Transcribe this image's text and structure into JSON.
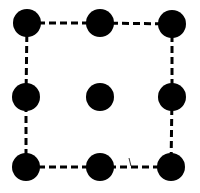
{
  "diagram": {
    "width": 200,
    "height": 193,
    "background": "#ffffff",
    "dot_color": "#000000",
    "dot_radius": 14,
    "line_color": "#000000",
    "line_width": 3,
    "dash_pattern": "7 4",
    "grid": {
      "rows": 3,
      "cols": 3
    },
    "dots": [
      {
        "id": "r1c1",
        "x": 27,
        "y": 23
      },
      {
        "id": "r1c2",
        "x": 100,
        "y": 23
      },
      {
        "id": "r1c3",
        "x": 172,
        "y": 24
      },
      {
        "id": "r2c1",
        "x": 26,
        "y": 97
      },
      {
        "id": "r2c2",
        "x": 100,
        "y": 97
      },
      {
        "id": "r2c3",
        "x": 172,
        "y": 97
      },
      {
        "id": "r3c1",
        "x": 26,
        "y": 167
      },
      {
        "id": "r3c2",
        "x": 100,
        "y": 167
      },
      {
        "id": "r3c3",
        "x": 171,
        "y": 167
      }
    ],
    "dashed_edges": [
      {
        "from": "r1c1",
        "to": "r1c2"
      },
      {
        "from": "r1c2",
        "to": "r1c3"
      },
      {
        "from": "r1c3",
        "to": "r2c3"
      },
      {
        "from": "r2c3",
        "to": "r3c3"
      },
      {
        "from": "r3c3",
        "to": "r3c2"
      },
      {
        "from": "r3c2",
        "to": "r3c1"
      },
      {
        "from": "r3c1",
        "to": "r2c1"
      },
      {
        "from": "r2c1",
        "to": "r1c1"
      }
    ],
    "isolated_dots": [
      "r2c2"
    ],
    "artifacts": [
      {
        "type": "tick",
        "x": 130,
        "y": 163
      }
    ]
  }
}
